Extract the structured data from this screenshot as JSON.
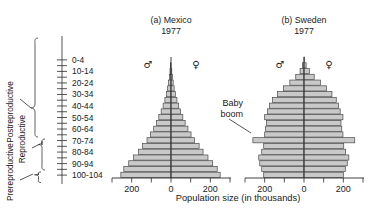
{
  "figure": {
    "axis_title": "Population size (in thousands)",
    "annotation_baby_boom_line1": "Baby",
    "annotation_baby_boom_line2": "boom",
    "male_symbol": "♂",
    "female_symbol": "♀",
    "bar_fill": "#c9c9c9",
    "bar_stroke": "#4a4a4a"
  },
  "category_labels": [
    {
      "id": "postreproductive",
      "label": "Postreproductive"
    },
    {
      "id": "reproductive",
      "label": "Reproductive"
    },
    {
      "id": "prereproductive",
      "label": "Prereproductive"
    }
  ],
  "age_tick_labels": [
    "100-104",
    "90-94",
    "80-84",
    "70-74",
    "60-64",
    "50-54",
    "40-44",
    "30-34",
    "20-24",
    "10-14",
    "0-4"
  ],
  "panels": [
    {
      "id": "mexico",
      "label": "(a) Mexico",
      "year": "1977"
    },
    {
      "id": "sweden",
      "label": "(b) Sweden",
      "year": "1977"
    }
  ],
  "x_tick_labels": [
    "200",
    "0",
    "200"
  ],
  "chart_data": {
    "type": "bar",
    "subtype": "population-pyramid",
    "title": "",
    "xlabel": "Population size (in thousands)",
    "ylabel": "",
    "xlim": [
      -300,
      300
    ],
    "x_ticks": [
      -200,
      0,
      200
    ],
    "x_tick_labels": [
      "200",
      "0",
      "200"
    ],
    "grid": false,
    "legend": [
      "♂ male (left)",
      "♀ female (right)"
    ],
    "annotations": [
      {
        "text": "Baby boom",
        "panel": "sweden",
        "age_group": "30-34",
        "note": "points to protruding bar cohort"
      }
    ],
    "age_groups": [
      "0-4",
      "5-9",
      "10-14",
      "15-19",
      "20-24",
      "25-29",
      "30-34",
      "35-39",
      "40-44",
      "45-49",
      "50-54",
      "55-59",
      "60-64",
      "65-69",
      "70-74",
      "75-79",
      "80-84",
      "85-89",
      "90-94",
      "95-99",
      "100-104"
    ],
    "reproductive_classes": {
      "prereproductive": [
        "0-4",
        "5-9",
        "10-14"
      ],
      "reproductive": [
        "15-19",
        "20-24",
        "25-29",
        "30-34",
        "35-39",
        "40-44"
      ],
      "postreproductive": [
        "45-49",
        "50-54",
        "55-59",
        "60-64",
        "65-69",
        "70-74",
        "75-79",
        "80-84",
        "85-89",
        "90-94",
        "95-99",
        "100-104"
      ]
    },
    "panels": [
      {
        "name": "(a) Mexico",
        "year": "1977",
        "series": [
          {
            "name": "male",
            "side": "left",
            "values": [
              255,
              240,
              215,
              190,
              165,
              145,
              122,
              104,
              88,
              74,
              62,
              50,
              40,
              31,
              23,
              17,
              12,
              8,
              5,
              3,
              1
            ]
          },
          {
            "name": "female",
            "side": "right",
            "values": [
              250,
              235,
              212,
              188,
              163,
              143,
              120,
              102,
              86,
              72,
              60,
              49,
              39,
              30,
              22,
              16,
              11,
              7,
              4,
              2,
              1
            ]
          }
        ]
      },
      {
        "name": "(b) Sweden",
        "year": "1977",
        "series": [
          {
            "name": "male",
            "side": "left",
            "values": [
              205,
              215,
              225,
              230,
              215,
              205,
              260,
              200,
              195,
              190,
              200,
              185,
              175,
              160,
              135,
              105,
              72,
              42,
              20,
              8,
              2
            ]
          },
          {
            "name": "female",
            "side": "right",
            "values": [
              200,
              210,
              220,
              228,
              212,
              202,
              258,
              198,
              192,
              188,
              198,
              184,
              176,
              164,
              142,
              115,
              84,
              52,
              27,
              11,
              3
            ]
          }
        ]
      }
    ]
  }
}
